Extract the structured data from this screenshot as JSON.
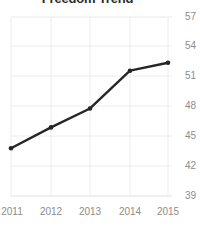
{
  "chart_data": {
    "type": "line",
    "title": "Freedom Trend",
    "xlabel": "",
    "ylabel": "",
    "categories": [
      "2011",
      "2012",
      "2013",
      "2014",
      "2015"
    ],
    "x": [
      2011,
      2012,
      2013,
      2014,
      2015
    ],
    "values": [
      43.8,
      45.9,
      47.8,
      51.6,
      52.4
    ],
    "series": [
      {
        "name": "Freedom Trend",
        "values": [
          43.8,
          45.9,
          47.8,
          51.6,
          52.4
        ]
      }
    ],
    "y_ticks": [
      39,
      42,
      45,
      48,
      51,
      54,
      57
    ],
    "y_tick_labels": [
      "39",
      "42",
      "45",
      "48",
      "51",
      "54",
      "57"
    ],
    "x_tick_labels": [
      "2011",
      "2012",
      "2013",
      "2014",
      "2015"
    ],
    "ylim": [
      39,
      57
    ],
    "xlim": [
      2011,
      2015
    ],
    "grid": true,
    "grid_axes": "both",
    "legend": false,
    "legend_position": "none",
    "markers": true,
    "y_axis_side": "right",
    "colors": {
      "line": "#262626",
      "marker": "#262626",
      "grid": "#e6e6e6",
      "tick_text": "#8c8c8c",
      "title_text": "#2b2b2b",
      "background": "#ffffff"
    }
  }
}
